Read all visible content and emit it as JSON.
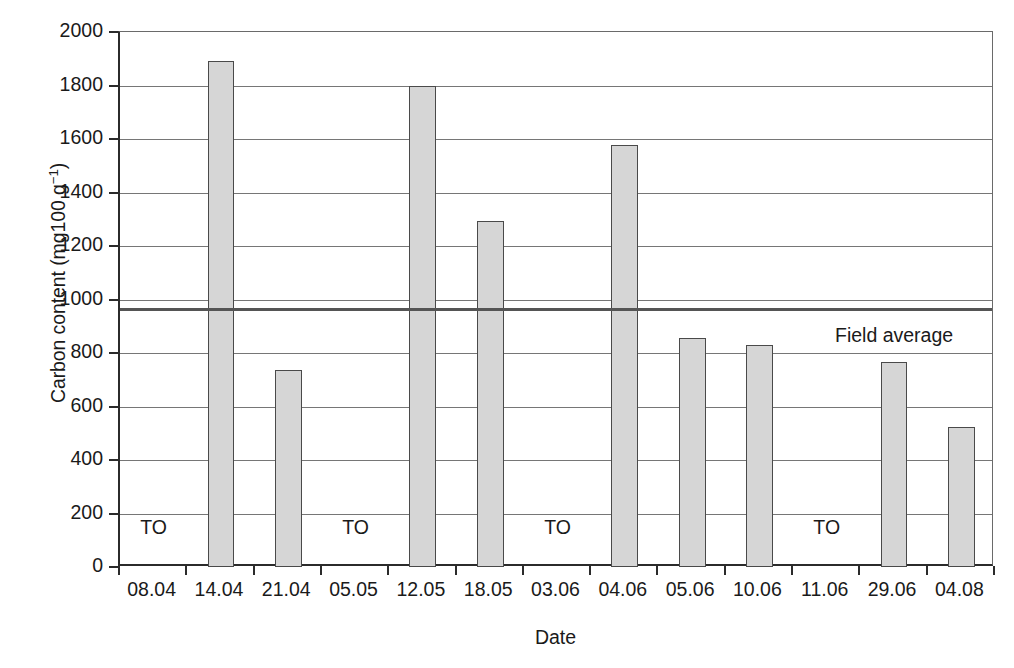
{
  "chart_data": {
    "type": "bar",
    "title": "",
    "xlabel": "Date",
    "ylabel": "Carbon content (mg100 g⁻¹)",
    "ylabel_main": "Carbon content (mg100 g",
    "ylabel_exponent": "−1",
    "ylabel_tail": ")",
    "categories": [
      "08.04",
      "14.04",
      "21.04",
      "05.05",
      "12.05",
      "18.05",
      "03.06",
      "04.06",
      "05.06",
      "10.06",
      "11.06",
      "29.06",
      "04.08"
    ],
    "values": [
      null,
      1890,
      735,
      null,
      1800,
      1292,
      null,
      1578,
      857,
      830,
      null,
      765,
      525
    ],
    "ylim": [
      0,
      2000
    ],
    "ytick_values": [
      0,
      200,
      400,
      600,
      800,
      1000,
      1200,
      1400,
      1600,
      1800,
      2000
    ],
    "ytick_labels": [
      "0",
      "200",
      "400",
      "600",
      "800",
      "1000",
      "1200",
      "1400",
      "1600",
      "1800",
      "2000"
    ],
    "grid": true,
    "legend": "none",
    "annotations": [
      {
        "name": "field-average",
        "label": "Field average",
        "value": 970,
        "type": "hline"
      },
      {
        "name": "treatment-marker",
        "label": "TO",
        "category": "08.04",
        "value": 150
      },
      {
        "name": "treatment-marker",
        "label": "TO",
        "category": "05.05",
        "value": 150
      },
      {
        "name": "treatment-marker",
        "label": "TO",
        "category": "03.06",
        "value": 150
      },
      {
        "name": "treatment-marker",
        "label": "TO",
        "category": "11.06",
        "value": 150
      }
    ],
    "colors": {
      "bar_fill": "#d6d6d6",
      "bar_edge": "#4a4a4a",
      "axis": "#2b2b2b",
      "grid": "#767676",
      "reference_line": "#555555",
      "background": "#ffffff"
    }
  }
}
